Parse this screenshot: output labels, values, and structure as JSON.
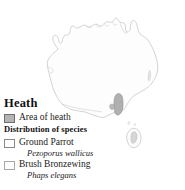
{
  "map": {
    "region_name": "Australia",
    "outline_color": "#c9c9c9",
    "land_fill": "#fdfdfd",
    "heath_fill": "#b0b0b0",
    "heath_stroke": "#8d8d8d",
    "heath_regions": [
      "southeastern coastal heath",
      "Tasmania heath"
    ]
  },
  "legend": {
    "title": "Heath",
    "area_entry": {
      "label": "Area of heath",
      "swatch": "filled-gray-swatch",
      "color": "#b4b4b4"
    },
    "subhead": "Distribution of species",
    "species": [
      {
        "common_name": "Ground Parrot",
        "scientific_name": "Pezoporus wallicus",
        "swatch": "open-white-swatch",
        "color": "#ffffff"
      },
      {
        "common_name": "Brush Bronzewing",
        "scientific_name": "Phaps elegans",
        "swatch": "dotted-swatch",
        "color": "#fdfdfd"
      }
    ]
  }
}
